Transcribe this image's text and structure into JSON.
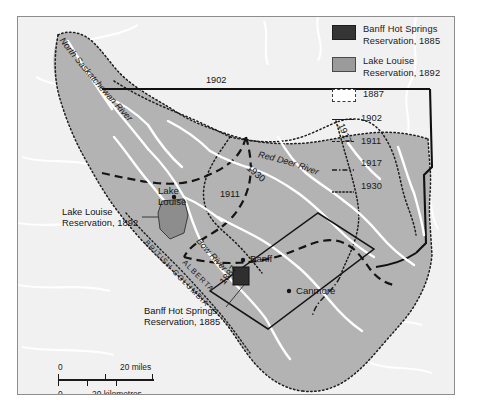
{
  "map": {
    "title": "Banff National Park boundary changes",
    "background_color": "#f1f1f1",
    "park_fill": "#b3b3b3",
    "reservation_1885_color": "#2f2f2f",
    "reservation_1892_color": "#8d8d8d",
    "river_color": "#ffffff",
    "frame_color": "#8d8d8d"
  },
  "legend": {
    "area_items": [
      {
        "label_line1": "Banff Hot Springs",
        "label_line2": "Reservation, 1885",
        "swatch": "dark-fill-swatch",
        "color": "#353535"
      },
      {
        "label_line1": "Lake Louise",
        "label_line2": "Reservation, 1892",
        "swatch": "gray-fill-swatch",
        "color": "#9b9b9b"
      }
    ],
    "line_items": [
      {
        "label": "1887",
        "style": "dotted-rectangle"
      },
      {
        "label": "1902",
        "style": "solid"
      },
      {
        "label": "1911",
        "style": "dashed"
      },
      {
        "label": "1917",
        "style": "dash-dot"
      },
      {
        "label": "1930",
        "style": "dotted"
      }
    ]
  },
  "annotations": {
    "lake_louise_reservation": {
      "line1": "Lake Louise",
      "line2": "Reservation, 1892"
    },
    "banff_hot_springs_reservation": {
      "line1": "Banff Hot Springs",
      "line2": "Reservation, 1885"
    }
  },
  "places": [
    {
      "name": "Lake Louise",
      "line1": "Lake",
      "line2": "Louise"
    },
    {
      "name": "Banff",
      "line1": "Banff"
    },
    {
      "name": "Canmore",
      "line1": "Canmore"
    }
  ],
  "provinces": [
    {
      "name": "ALBERTA"
    },
    {
      "name": "BRITISH COLUMBIA"
    }
  ],
  "rivers": [
    {
      "name": "North Saskatchewan River"
    },
    {
      "name": "Red Deer River"
    },
    {
      "name": "Bow River"
    }
  ],
  "boundary_year_labels": [
    {
      "year": "1902"
    },
    {
      "year": "1917"
    },
    {
      "year": "1930"
    },
    {
      "year": "1911"
    },
    {
      "year": "1887"
    }
  ],
  "scale": {
    "miles": {
      "zero": "0",
      "max": "20 miles"
    },
    "kilometres": {
      "zero": "0",
      "max": "20 kilometres"
    }
  }
}
